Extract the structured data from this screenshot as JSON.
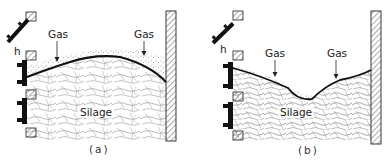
{
  "figure": {
    "panels": [
      {
        "id": "a",
        "caption": "(a)",
        "labels": {
          "gas_left": "Gas",
          "gas_right": "Gas",
          "silage": "Silage",
          "height_marker": "h"
        },
        "surface_shape": "convex (domed)"
      },
      {
        "id": "b",
        "caption": "(b)",
        "labels": {
          "gas_left": "Gas",
          "gas_right": "Gas",
          "silage": "Silage",
          "height_marker": "h"
        },
        "surface_shape": "concave (dipped)"
      }
    ],
    "colors": {
      "ink": "#1a1a1a",
      "hatch": "#555555",
      "background": "#ffffff"
    }
  }
}
